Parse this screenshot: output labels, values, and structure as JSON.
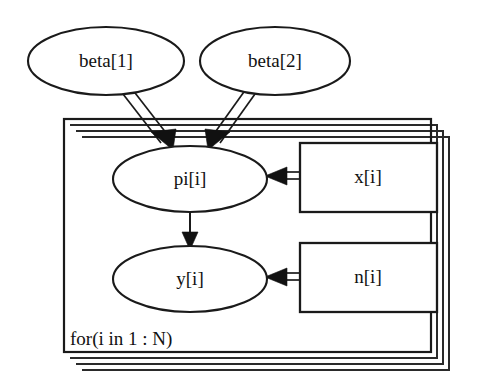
{
  "diagram": {
    "type": "directed-acyclic-graph",
    "notation": "BUGS / DoodleBUGS doodle",
    "background_color": "#ffffff",
    "line_color": "#1a1a1a",
    "nodes": [
      {
        "id": "beta1",
        "label": "beta[1]",
        "shape": "ellipse",
        "role": "stochastic-parameter",
        "inside_plate": false,
        "cx": 106,
        "cy": 61,
        "rx": 78,
        "ry": 34
      },
      {
        "id": "beta2",
        "label": "beta[2]",
        "shape": "ellipse",
        "role": "stochastic-parameter",
        "inside_plate": false,
        "cx": 275,
        "cy": 61,
        "rx": 75,
        "ry": 34
      },
      {
        "id": "pi",
        "label": "pi[i]",
        "shape": "ellipse",
        "role": "logical-node",
        "inside_plate": true,
        "cx": 190,
        "cy": 179,
        "rx": 77,
        "ry": 33
      },
      {
        "id": "y",
        "label": "y[i]",
        "shape": "ellipse",
        "role": "stochastic-observed",
        "inside_plate": true,
        "cx": 190,
        "cy": 279,
        "rx": 77,
        "ry": 33
      },
      {
        "id": "x",
        "label": "x[i]",
        "shape": "rectangle",
        "role": "constant-data",
        "inside_plate": true,
        "x": 300,
        "y": 143,
        "width": 137,
        "height": 69
      },
      {
        "id": "n",
        "label": "n[i]",
        "shape": "rectangle",
        "role": "constant-data",
        "inside_plate": true,
        "x": 300,
        "y": 243,
        "width": 137,
        "height": 69
      }
    ],
    "edges": [
      {
        "id": "beta1-to-pi",
        "from": "beta1",
        "to": "pi",
        "style": "double-line",
        "relation": "logical",
        "arrowhead": "solid-triangle"
      },
      {
        "id": "beta2-to-pi",
        "from": "beta2",
        "to": "pi",
        "style": "double-line",
        "relation": "logical",
        "arrowhead": "solid-triangle"
      },
      {
        "id": "x-to-pi",
        "from": "x",
        "to": "pi",
        "style": "double-line",
        "relation": "logical",
        "arrowhead": "solid-triangle"
      },
      {
        "id": "pi-to-y",
        "from": "pi",
        "to": "y",
        "style": "single-line",
        "relation": "stochastic",
        "arrowhead": "solid-triangle"
      },
      {
        "id": "n-to-y",
        "from": "n",
        "to": "y",
        "style": "double-line",
        "relation": "logical",
        "arrowhead": "solid-triangle"
      }
    ],
    "plate": {
      "id": "plate-i",
      "label": "for(i in 1 : N)",
      "x": 64,
      "y": 119,
      "width": 367,
      "height": 233,
      "stack_copies": 3,
      "stack_offset": 6,
      "label_x": 70,
      "label_y": 345
    }
  }
}
